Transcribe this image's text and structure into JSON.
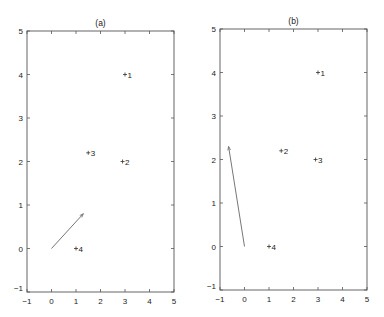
{
  "chart_data": [
    {
      "type": "scatter",
      "title": "(a)",
      "xlabel": "",
      "ylabel": "",
      "xlim": [
        -1,
        5
      ],
      "ylim": [
        -1,
        5
      ],
      "xticks": [
        "-1",
        "0",
        "1",
        "2",
        "3",
        "4",
        "5"
      ],
      "yticks": [
        "-1",
        "0",
        "1",
        "2",
        "3",
        "4",
        "5"
      ],
      "grid": false,
      "points": [
        {
          "label": "1",
          "x": 3,
          "y": 4
        },
        {
          "label": "2",
          "x": 2.9,
          "y": 2
        },
        {
          "label": "3",
          "x": 1.5,
          "y": 2.2
        },
        {
          "label": "4",
          "x": 1.0,
          "y": 0
        }
      ],
      "arrow": {
        "x0": 0,
        "y0": 0,
        "x1": 1.3,
        "y1": 0.8
      }
    },
    {
      "type": "scatter",
      "title": "(b)",
      "xlabel": "",
      "ylabel": "",
      "xlim": [
        -1,
        5
      ],
      "ylim": [
        -1,
        5
      ],
      "xticks": [
        "-1",
        "0",
        "1",
        "2",
        "3",
        "4",
        "5"
      ],
      "yticks": [
        "-1",
        "0",
        "1",
        "2",
        "3",
        "4",
        "5"
      ],
      "grid": false,
      "points": [
        {
          "label": "1",
          "x": 3,
          "y": 4
        },
        {
          "label": "2",
          "x": 1.5,
          "y": 2.2
        },
        {
          "label": "3",
          "x": 2.9,
          "y": 2
        },
        {
          "label": "4",
          "x": 1.0,
          "y": 0
        }
      ],
      "arrow": {
        "x0": 0,
        "y0": 0,
        "x1": -0.65,
        "y1": 2.3
      }
    }
  ]
}
